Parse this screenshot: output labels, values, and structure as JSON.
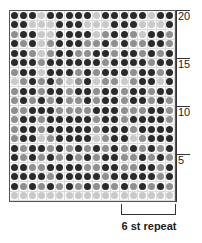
{
  "chart_data": {
    "type": "heatmap",
    "title": "",
    "columns": 18,
    "rows": 20,
    "legend": {
      "D": "dark",
      "M": "medium gray",
      "L": "light gray"
    },
    "colors": {
      "D": "#2a2a2a",
      "M": "#8f8f8f",
      "L": "#c9c9c9"
    },
    "row_labels": [
      {
        "row": 20,
        "label": "20"
      },
      {
        "row": 15,
        "label": "15"
      },
      {
        "row": 10,
        "label": "10"
      },
      {
        "row": 5,
        "label": "5"
      }
    ],
    "repeat_label": "6 st repeat",
    "repeat_stitches": 6,
    "grid_top_to_bottom": [
      "DDDLDDDDDLDDDDDLDD",
      "DDLLLDDDLLLDDDLLLD",
      "MDDLLDDDDLMDDMLDDM",
      "DMDLMDDDMMDMDMMDDM",
      "DDMLMDDMMDDMDDMDMD",
      "DDDMDDDDDDMDDDDMDD",
      "MDDLDDDMDMDDDMDDMD",
      "LMDMDMLMDLMMLMDDLD",
      "MDDMDDMDDMDDMDDMDD",
      "MDMDMDMMDMDDMDDMDM",
      "MMDDDMMMMDDDMMMDDM",
      "MDDMDDDDDMDDMDDDDM",
      "MDDMDDDDDMDDDMDDDD",
      "MDDLMDDDDLMDDLMDDD",
      "DMDDMDMDMDMDMDMDMD",
      "DMDMDMDMDMDDMMDMDM",
      "DDMMDDDDMMDDMMDDMD",
      "DDDDMDDDDDMDDDDDMD",
      "DMDMDMDMDMDMDMDMDM",
      "LLLLLLLLLLLLLLLLLL"
    ]
  }
}
